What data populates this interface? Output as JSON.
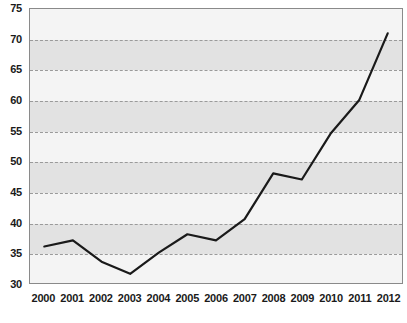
{
  "chart_data": {
    "type": "line",
    "title": "",
    "subtitle": "",
    "xlabel": "",
    "ylabel": "",
    "categories": [
      "2000",
      "2001",
      "2002",
      "2003",
      "2004",
      "2005",
      "2006",
      "2007",
      "2008",
      "2009",
      "2010",
      "2011",
      "2012"
    ],
    "x": [
      2000,
      2001,
      2002,
      2003,
      2004,
      2005,
      2006,
      2007,
      2008,
      2009,
      2010,
      2011,
      2012
    ],
    "values": [
      36,
      37,
      33.5,
      31.5,
      35,
      38,
      37,
      40.5,
      48,
      47,
      54.5,
      60,
      71
    ],
    "series": [
      {
        "name": "",
        "values": [
          36,
          37,
          33.5,
          31.5,
          35,
          38,
          37,
          40.5,
          48,
          47,
          54.5,
          60,
          71
        ]
      }
    ],
    "ylim": [
      30,
      75
    ],
    "xlim": [
      2000,
      2012
    ],
    "yticks": [
      30,
      35,
      40,
      45,
      50,
      55,
      60,
      65,
      70,
      75
    ],
    "ytick_labels": [
      "30",
      "35",
      "40",
      "45",
      "50",
      "55",
      "60",
      "65",
      "70",
      "75"
    ],
    "xtick_labels": [
      "2000",
      "2001",
      "2002",
      "2003",
      "2004",
      "2005",
      "2006",
      "2007",
      "2008",
      "2009",
      "2010",
      "2011",
      "2012"
    ],
    "grid": true,
    "grid_style": "dashed",
    "grid_axis": "y",
    "legend": false,
    "legend_position": "none",
    "annotations": [],
    "line_color": "#1a1a1a",
    "grid_color": "#9a9a9a",
    "band_color_dark": "#e2e2e2",
    "band_color_light": "#f4f4f4",
    "plot_border_color": "#8a8a8a",
    "background_color": "#ffffff"
  }
}
